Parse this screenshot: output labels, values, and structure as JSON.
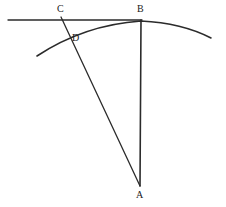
{
  "figure": {
    "type": "geometry-diagram",
    "title": "",
    "background_color": "#ffffff",
    "stroke_color": "#2b2b2b",
    "width": 226,
    "height": 207,
    "labels": {
      "A": "A",
      "B": "B",
      "C": "C",
      "D": "D"
    },
    "points": {
      "A": {
        "x": 140,
        "y": 186
      },
      "B": {
        "x": 141,
        "y": 21
      },
      "C": {
        "x": 61,
        "y": 17
      },
      "D": {
        "x": 68,
        "y": 34
      }
    },
    "elements": [
      {
        "name": "horizontal-line-through-C-and-B",
        "kind": "line",
        "from": {
          "x": 8,
          "y": 20
        },
        "to": {
          "x": 142,
          "y": 20
        },
        "stroke_width": 1.3
      },
      {
        "name": "segment-C-to-A",
        "kind": "line",
        "from": {
          "x": 61,
          "y": 17
        },
        "to": {
          "x": 140,
          "y": 186
        },
        "stroke_width": 1.3
      },
      {
        "name": "segment-B-to-A",
        "kind": "line",
        "from": {
          "x": 141,
          "y": 20
        },
        "to": {
          "x": 140,
          "y": 186
        },
        "stroke_width": 1.6
      },
      {
        "name": "arc-through-D-and-B",
        "kind": "arc",
        "path": "M 37 56 Q 84 25 141 21 Q 182 23 211 38",
        "stroke_width": 1.6
      }
    ]
  }
}
